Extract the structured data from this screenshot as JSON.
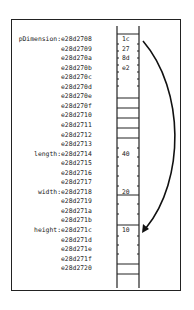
{
  "diagram": {
    "rows": [
      {
        "label": "pDimension:",
        "address": "e28d2708",
        "value": "1c"
      },
      {
        "label": "",
        "address": "e28d2709",
        "value": "27"
      },
      {
        "label": "",
        "address": "e28d270a",
        "value": "8d"
      },
      {
        "label": "",
        "address": "e28d270b",
        "value": "e2"
      },
      {
        "label": "",
        "address": "e28d270c",
        "value": ""
      },
      {
        "label": "",
        "address": "e28d270d",
        "value": ""
      },
      {
        "label": "",
        "address": "e28d270e",
        "value": ""
      },
      {
        "label": "",
        "address": "e28d270f",
        "value": ""
      },
      {
        "label": "",
        "address": "e28d2710",
        "value": ""
      },
      {
        "label": "",
        "address": "e28d2711",
        "value": ""
      },
      {
        "label": "",
        "address": "e28d2712",
        "value": ""
      },
      {
        "label": "",
        "address": "e28d2713",
        "value": ""
      },
      {
        "label": "length:",
        "address": "e28d2714",
        "value": "40"
      },
      {
        "label": "",
        "address": "e28d2715",
        "value": ""
      },
      {
        "label": "",
        "address": "e28d2716",
        "value": ""
      },
      {
        "label": "",
        "address": "e28d2717",
        "value": ""
      },
      {
        "label": "width:",
        "address": "e28d2718",
        "value": "20"
      },
      {
        "label": "",
        "address": "e28d2719",
        "value": ""
      },
      {
        "label": "",
        "address": "e28d271a",
        "value": ""
      },
      {
        "label": "",
        "address": "e28d271b",
        "value": ""
      },
      {
        "label": "height:",
        "address": "e28d271c",
        "value": "10"
      },
      {
        "label": "",
        "address": "e28d271d",
        "value": ""
      },
      {
        "label": "",
        "address": "e28d271e",
        "value": ""
      },
      {
        "label": "",
        "address": "e28d271f",
        "value": ""
      },
      {
        "label": "",
        "address": "e28d2720",
        "value": ""
      }
    ],
    "arrow": {
      "from": "pDimension",
      "to": "height"
    },
    "colors": {
      "line": "#222222",
      "background": "#ffffff"
    }
  }
}
